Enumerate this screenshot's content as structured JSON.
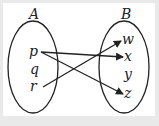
{
  "diagram": {
    "type": "mapping",
    "sets": [
      {
        "name": "A",
        "elements": [
          "p",
          "q",
          "r"
        ]
      },
      {
        "name": "B",
        "elements": [
          "w",
          "x",
          "y",
          "z"
        ]
      }
    ],
    "arrows": [
      {
        "from": "p",
        "to": "x"
      },
      {
        "from": "p",
        "to": "z"
      },
      {
        "from": "r",
        "to": "w"
      }
    ]
  },
  "labels": {
    "A": "A",
    "B": "B",
    "p": "p",
    "q": "q",
    "r": "r",
    "w": "w",
    "x": "x",
    "y": "y",
    "z": "z"
  },
  "colors": {
    "background": "#e9e9e9",
    "panel": "#ffffff",
    "ink": "#222222"
  }
}
